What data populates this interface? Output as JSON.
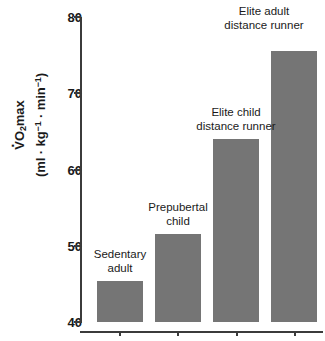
{
  "chart_data": {
    "type": "bar",
    "title": "",
    "xlabel": "",
    "ylabel": "VO2max (ml · kg−1 · min−1)",
    "ylim": [
      40,
      80
    ],
    "yticks": [
      40,
      50,
      60,
      70,
      80
    ],
    "grid": false,
    "legend": "none",
    "bar_color": "#757575",
    "axis_color": "#3b3b3b",
    "categories": [
      "Sedentary adult",
      "Prepubertal child",
      "Elite child distance runner",
      "Elite adult distance runner"
    ],
    "values": [
      45.4,
      51.5,
      64.0,
      75.5
    ],
    "bars": [
      {
        "label_line1": "Sedentary",
        "label_line2": "adult",
        "value": 45.4
      },
      {
        "label_line1": "Prepubertal",
        "label_line2": "child",
        "value": 51.5
      },
      {
        "label_line1": "Elite child",
        "label_line2": "distance runner",
        "value": 64.0
      },
      {
        "label_line1": "Elite adult",
        "label_line2": "distance runner",
        "value": 75.5
      }
    ]
  },
  "axis": {
    "y_label_line1_prefix": "V",
    "y_label_line1_o": "O",
    "y_label_line1_sub": "2",
    "y_label_line1_suffix": "max",
    "y_label_line2_open": "(ml · kg",
    "y_label_line2_sup1": "−1",
    "y_label_line2_mid": " · min",
    "y_label_line2_sup2": "−1",
    "y_label_line2_close": ")",
    "tick_80": "80",
    "tick_70": "70",
    "tick_60": "60",
    "tick_50": "50",
    "tick_40": "40"
  }
}
